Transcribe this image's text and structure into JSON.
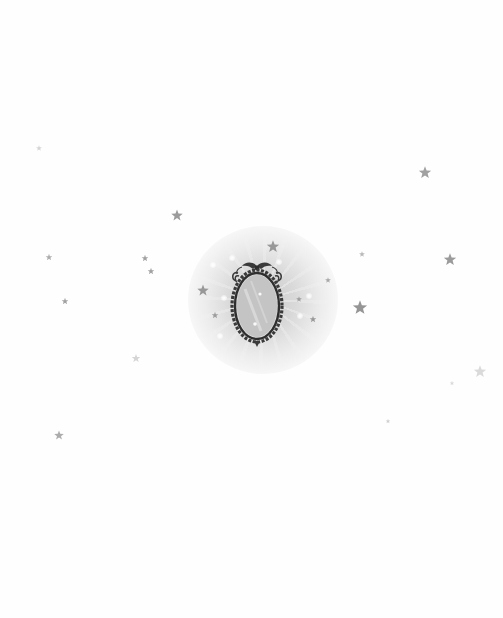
{
  "scene": {
    "background_color": "#fefefe",
    "glow_color": "#c8c8c8",
    "star_color": "#8a8a8a",
    "mirror": {
      "icon": "ornate-oval-mirror-icon",
      "frame_color": "#3a3a3a",
      "glass_color": "#c4c4c4"
    },
    "stars": [
      {
        "x": 39,
        "y": 148,
        "size": 6,
        "opacity": 0.35
      },
      {
        "x": 177,
        "y": 215,
        "size": 12,
        "opacity": 0.85
      },
      {
        "x": 273,
        "y": 246,
        "size": 13,
        "opacity": 0.85
      },
      {
        "x": 425,
        "y": 172,
        "size": 13,
        "opacity": 0.8
      },
      {
        "x": 49,
        "y": 257,
        "size": 7,
        "opacity": 0.7
      },
      {
        "x": 145,
        "y": 258,
        "size": 7,
        "opacity": 0.8
      },
      {
        "x": 151,
        "y": 271,
        "size": 7,
        "opacity": 0.8
      },
      {
        "x": 450,
        "y": 259,
        "size": 13,
        "opacity": 0.85
      },
      {
        "x": 362,
        "y": 254,
        "size": 6,
        "opacity": 0.6
      },
      {
        "x": 65,
        "y": 301,
        "size": 7,
        "opacity": 0.8
      },
      {
        "x": 203,
        "y": 290,
        "size": 12,
        "opacity": 0.85
      },
      {
        "x": 328,
        "y": 280,
        "size": 6,
        "opacity": 0.7
      },
      {
        "x": 360,
        "y": 307,
        "size": 15,
        "opacity": 0.9
      },
      {
        "x": 313,
        "y": 319,
        "size": 7,
        "opacity": 0.85
      },
      {
        "x": 299,
        "y": 299,
        "size": 6,
        "opacity": 0.75
      },
      {
        "x": 215,
        "y": 315,
        "size": 7,
        "opacity": 0.8
      },
      {
        "x": 136,
        "y": 358,
        "size": 9,
        "opacity": 0.35
      },
      {
        "x": 480,
        "y": 371,
        "size": 13,
        "opacity": 0.3
      },
      {
        "x": 452,
        "y": 383,
        "size": 5,
        "opacity": 0.3
      },
      {
        "x": 59,
        "y": 435,
        "size": 10,
        "opacity": 0.7
      },
      {
        "x": 388,
        "y": 421,
        "size": 5,
        "opacity": 0.4
      }
    ],
    "sparkles": [
      {
        "x": 232,
        "y": 258
      },
      {
        "x": 213,
        "y": 265
      },
      {
        "x": 224,
        "y": 298
      },
      {
        "x": 258,
        "y": 300
      },
      {
        "x": 300,
        "y": 316
      },
      {
        "x": 220,
        "y": 336
      },
      {
        "x": 256,
        "y": 330
      },
      {
        "x": 279,
        "y": 262
      },
      {
        "x": 309,
        "y": 296
      }
    ]
  }
}
